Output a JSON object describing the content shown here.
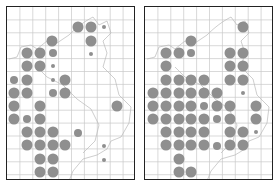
{
  "figure": {
    "panels": [
      {
        "id": "left",
        "frame": {
          "x": 6,
          "y": 6,
          "w": 129,
          "h": 174
        },
        "dots": [
          {
            "x": 77,
            "y": 26,
            "size": "big"
          },
          {
            "x": 90,
            "y": 26,
            "size": "big"
          },
          {
            "x": 103,
            "y": 26,
            "size": "small"
          },
          {
            "x": 51,
            "y": 40,
            "size": "big"
          },
          {
            "x": 90,
            "y": 40,
            "size": "big"
          },
          {
            "x": 26,
            "y": 52,
            "size": "big"
          },
          {
            "x": 39,
            "y": 52,
            "size": "big"
          },
          {
            "x": 52,
            "y": 52,
            "size": "medium"
          },
          {
            "x": 90,
            "y": 53,
            "size": "small"
          },
          {
            "x": 26,
            "y": 65,
            "size": "big"
          },
          {
            "x": 39,
            "y": 65,
            "size": "big"
          },
          {
            "x": 52,
            "y": 65,
            "size": "small"
          },
          {
            "x": 13,
            "y": 79,
            "size": "medium"
          },
          {
            "x": 26,
            "y": 79,
            "size": "big"
          },
          {
            "x": 52,
            "y": 79,
            "size": "small"
          },
          {
            "x": 64,
            "y": 79,
            "size": "big"
          },
          {
            "x": 13,
            "y": 92,
            "size": "big"
          },
          {
            "x": 26,
            "y": 92,
            "size": "big"
          },
          {
            "x": 52,
            "y": 92,
            "size": "medium"
          },
          {
            "x": 64,
            "y": 92,
            "size": "big"
          },
          {
            "x": 13,
            "y": 105,
            "size": "big"
          },
          {
            "x": 39,
            "y": 105,
            "size": "big"
          },
          {
            "x": 116,
            "y": 105,
            "size": "big"
          },
          {
            "x": 13,
            "y": 118,
            "size": "big"
          },
          {
            "x": 26,
            "y": 118,
            "size": "medium"
          },
          {
            "x": 39,
            "y": 118,
            "size": "big"
          },
          {
            "x": 26,
            "y": 131,
            "size": "big"
          },
          {
            "x": 39,
            "y": 131,
            "size": "big"
          },
          {
            "x": 52,
            "y": 131,
            "size": "big"
          },
          {
            "x": 77,
            "y": 132,
            "size": "medium"
          },
          {
            "x": 26,
            "y": 144,
            "size": "big"
          },
          {
            "x": 39,
            "y": 144,
            "size": "big"
          },
          {
            "x": 52,
            "y": 144,
            "size": "big"
          },
          {
            "x": 64,
            "y": 144,
            "size": "big"
          },
          {
            "x": 103,
            "y": 145,
            "size": "small"
          },
          {
            "x": 39,
            "y": 158,
            "size": "big"
          },
          {
            "x": 52,
            "y": 158,
            "size": "big"
          },
          {
            "x": 103,
            "y": 159,
            "size": "small"
          },
          {
            "x": 39,
            "y": 171,
            "size": "big"
          },
          {
            "x": 52,
            "y": 171,
            "size": "big"
          }
        ]
      },
      {
        "id": "right",
        "frame": {
          "x": 144,
          "y": 6,
          "w": 129,
          "h": 174
        },
        "dots": [
          {
            "x": 242,
            "y": 26,
            "size": "big"
          },
          {
            "x": 190,
            "y": 40,
            "size": "big"
          },
          {
            "x": 165,
            "y": 52,
            "size": "big"
          },
          {
            "x": 178,
            "y": 52,
            "size": "big"
          },
          {
            "x": 190,
            "y": 52,
            "size": "medium"
          },
          {
            "x": 229,
            "y": 52,
            "size": "big"
          },
          {
            "x": 242,
            "y": 52,
            "size": "big"
          },
          {
            "x": 165,
            "y": 65,
            "size": "big"
          },
          {
            "x": 229,
            "y": 65,
            "size": "big"
          },
          {
            "x": 242,
            "y": 65,
            "size": "big"
          },
          {
            "x": 165,
            "y": 79,
            "size": "big"
          },
          {
            "x": 178,
            "y": 79,
            "size": "big"
          },
          {
            "x": 190,
            "y": 79,
            "size": "big"
          },
          {
            "x": 203,
            "y": 79,
            "size": "big"
          },
          {
            "x": 229,
            "y": 79,
            "size": "big"
          },
          {
            "x": 242,
            "y": 79,
            "size": "big"
          },
          {
            "x": 152,
            "y": 92,
            "size": "big"
          },
          {
            "x": 165,
            "y": 92,
            "size": "big"
          },
          {
            "x": 178,
            "y": 92,
            "size": "big"
          },
          {
            "x": 190,
            "y": 92,
            "size": "big"
          },
          {
            "x": 203,
            "y": 92,
            "size": "big"
          },
          {
            "x": 216,
            "y": 92,
            "size": "big"
          },
          {
            "x": 242,
            "y": 92,
            "size": "small"
          },
          {
            "x": 152,
            "y": 105,
            "size": "big"
          },
          {
            "x": 165,
            "y": 105,
            "size": "big"
          },
          {
            "x": 178,
            "y": 105,
            "size": "big"
          },
          {
            "x": 190,
            "y": 105,
            "size": "big"
          },
          {
            "x": 203,
            "y": 105,
            "size": "medium"
          },
          {
            "x": 216,
            "y": 105,
            "size": "big"
          },
          {
            "x": 229,
            "y": 105,
            "size": "big"
          },
          {
            "x": 255,
            "y": 105,
            "size": "big"
          },
          {
            "x": 152,
            "y": 118,
            "size": "big"
          },
          {
            "x": 165,
            "y": 118,
            "size": "big"
          },
          {
            "x": 178,
            "y": 118,
            "size": "big"
          },
          {
            "x": 190,
            "y": 118,
            "size": "big"
          },
          {
            "x": 203,
            "y": 118,
            "size": "big"
          },
          {
            "x": 216,
            "y": 118,
            "size": "medium"
          },
          {
            "x": 229,
            "y": 118,
            "size": "big"
          },
          {
            "x": 255,
            "y": 118,
            "size": "big"
          },
          {
            "x": 165,
            "y": 131,
            "size": "big"
          },
          {
            "x": 178,
            "y": 131,
            "size": "big"
          },
          {
            "x": 190,
            "y": 131,
            "size": "big"
          },
          {
            "x": 203,
            "y": 131,
            "size": "big"
          },
          {
            "x": 229,
            "y": 131,
            "size": "big"
          },
          {
            "x": 242,
            "y": 131,
            "size": "big"
          },
          {
            "x": 255,
            "y": 131,
            "size": "small"
          },
          {
            "x": 165,
            "y": 144,
            "size": "big"
          },
          {
            "x": 178,
            "y": 144,
            "size": "big"
          },
          {
            "x": 190,
            "y": 144,
            "size": "big"
          },
          {
            "x": 203,
            "y": 144,
            "size": "big"
          },
          {
            "x": 216,
            "y": 145,
            "size": "medium"
          },
          {
            "x": 229,
            "y": 144,
            "size": "big"
          },
          {
            "x": 242,
            "y": 144,
            "size": "big"
          },
          {
            "x": 178,
            "y": 158,
            "size": "big"
          },
          {
            "x": 178,
            "y": 171,
            "size": "big"
          },
          {
            "x": 190,
            "y": 171,
            "size": "big"
          }
        ]
      }
    ],
    "grid": {
      "cell": 12.9,
      "cols": 10,
      "rows": 14
    },
    "dot_sizes": {
      "big": 5.5,
      "medium": 4,
      "small": 2
    },
    "colors": {
      "dot": "#8f8f8f",
      "grid": "#c8c8c8",
      "boundary": "#b9b9b9",
      "frame": "#222222"
    }
  }
}
